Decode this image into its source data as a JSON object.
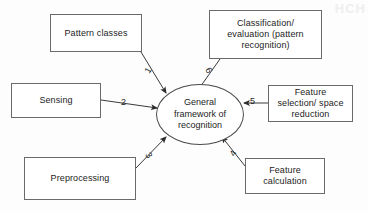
{
  "diagram": {
    "title": "General framework of recognition",
    "type": "node-edge-diagram",
    "background_color": "#fdfdfd",
    "stroke_color": "#6a6a6a",
    "text_color": "#1c1c1c",
    "watermark": "HCH",
    "center_node": {
      "id": "center",
      "shape": "ellipse",
      "label": "General\nframework of\nrecognition"
    },
    "nodes": [
      {
        "id": "pattern-classes",
        "shape": "rectangle",
        "label": "Pattern classes"
      },
      {
        "id": "classification-evaluation",
        "shape": "rectangle",
        "label": "Classification/\nevaluation (pattern\nrecognition)"
      },
      {
        "id": "sensing",
        "shape": "rectangle",
        "label": "Sensing"
      },
      {
        "id": "feature-selection",
        "shape": "rectangle",
        "label": "Feature\nselection/ space\nreduction"
      },
      {
        "id": "preprocessing",
        "shape": "rectangle",
        "label": "Preprocessing"
      },
      {
        "id": "feature-calculation",
        "shape": "rectangle",
        "label": "Feature\ncalculation"
      }
    ],
    "edges": [
      {
        "id": "edge-1",
        "label": "1",
        "from": "pattern-classes",
        "to": "center",
        "direction": "to-center"
      },
      {
        "id": "edge-2",
        "label": "2",
        "from": "sensing",
        "to": "center",
        "direction": "to-center"
      },
      {
        "id": "edge-3",
        "label": "3",
        "from": "preprocessing",
        "to": "center",
        "direction": "to-center"
      },
      {
        "id": "edge-4",
        "label": "4",
        "from": "feature-calculation",
        "to": "center",
        "direction": "to-center"
      },
      {
        "id": "edge-5",
        "label": "5",
        "from": "feature-selection",
        "to": "center",
        "direction": "to-center"
      },
      {
        "id": "edge-6",
        "label": "6",
        "from": "classification-evaluation",
        "to": "center",
        "direction": "to-center"
      }
    ]
  }
}
